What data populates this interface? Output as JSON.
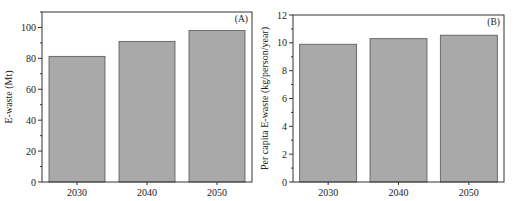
{
  "chart_data": [
    {
      "type": "bar",
      "panel_label": "(A)",
      "title": "",
      "xlabel": "",
      "ylabel": "E-waste (Mt)",
      "categories": [
        "2030",
        "2040",
        "2050"
      ],
      "values": [
        81.3,
        91.0,
        98.0
      ],
      "ylim": [
        0,
        110
      ],
      "yticks": [
        0,
        20,
        40,
        60,
        80,
        100
      ],
      "minor_ticks": true,
      "grid": false,
      "legend": null,
      "bar_color": "#a9a9a9",
      "bar_edge_color": "#555555"
    },
    {
      "type": "bar",
      "panel_label": "(B)",
      "title": "",
      "xlabel": "",
      "ylabel": "Per capita E-waste (kg/person/year)",
      "categories": [
        "2030",
        "2040",
        "2050"
      ],
      "values": [
        9.9,
        10.3,
        10.55
      ],
      "ylim": [
        0,
        12
      ],
      "yticks": [
        0,
        2,
        4,
        6,
        8,
        10,
        12
      ],
      "minor_ticks": true,
      "grid": false,
      "legend": null,
      "bar_color": "#a9a9a9",
      "bar_edge_color": "#555555"
    }
  ],
  "layout": {
    "panels": [
      {
        "frame": {
          "x0": 42,
          "x1": 252,
          "y0": 12,
          "y1": 182
        },
        "bar_width": 56
      },
      {
        "frame": {
          "x0": 293,
          "x1": 504,
          "y0": 15,
          "y1": 182
        },
        "bar_width": 57
      }
    ]
  }
}
